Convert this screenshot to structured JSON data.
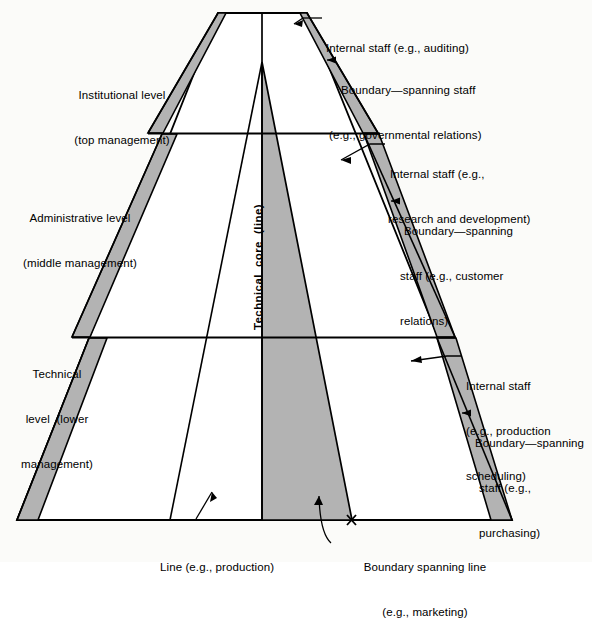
{
  "figure": {
    "shape_fill_grey": "#b3b3b3",
    "stroke_color": "#000000",
    "background": "#fbfbf9"
  },
  "level_labels": [
    {
      "id": "institutional",
      "line1": "Institutional level",
      "line2": "(top management)"
    },
    {
      "id": "administrative",
      "line1": "Administrative level",
      "line2": "(middle management)"
    },
    {
      "id": "technical",
      "line1": "Technical",
      "line2": "level  (lower",
      "line3": "management)"
    }
  ],
  "core_label": "Technical  core  (line)",
  "callouts": [
    {
      "id": "internal-staff-auditing",
      "line1": "Internal staff (e.g., auditing)",
      "line2": ""
    },
    {
      "id": "boundary-spanning-governmental",
      "line1": "Boundary—spanning staff",
      "line2": "(e.g., governmental relations)"
    },
    {
      "id": "internal-staff-rnd",
      "line1": "Internal staff (e.g.,",
      "line2": "research and development)"
    },
    {
      "id": "boundary-spanning-customer",
      "line1": "Boundary—spanning",
      "line2": "staff (e.g., customer",
      "line3": "relations)"
    },
    {
      "id": "internal-staff-production-scheduling",
      "line1": "Internal staff",
      "line2": "(e.g., production",
      "line3": "scheduling)"
    },
    {
      "id": "boundary-spanning-purchasing",
      "line1": "Boundary—spanning",
      "line2": "staff (e.g.,",
      "line3": "purchasing)"
    },
    {
      "id": "line-production",
      "line1": "Line (e.g., production)",
      "line2": ""
    },
    {
      "id": "boundary-spanning-line-marketing",
      "line1": "Boundary spanning line",
      "line2": "(e.g., marketing)"
    }
  ]
}
